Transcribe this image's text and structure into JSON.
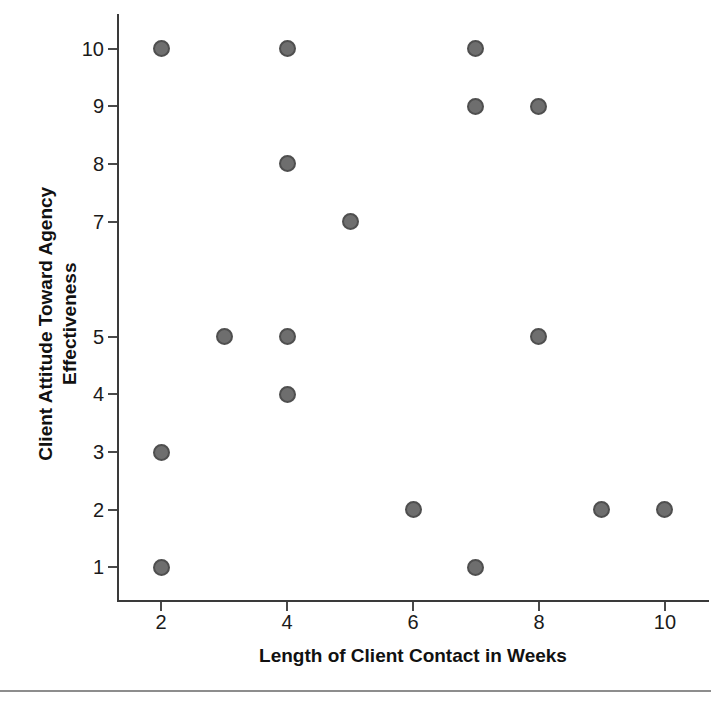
{
  "chart_data": {
    "type": "scatter",
    "title": "",
    "xlabel": "Length of Client Contact in Weeks",
    "ylabel_lines": [
      "Client Attitude Toward Agency",
      "Effectiveness"
    ],
    "ylabel": "Client Attitude Toward Agency Effectiveness",
    "xlim": [
      1.3,
      10.7
    ],
    "ylim": [
      0.4,
      10.6
    ],
    "grid": false,
    "legend": "none",
    "marker": {
      "shape": "circle",
      "fill_color": "#6e6e6e",
      "edge_color": "#4f4f4f",
      "size_px": 17
    },
    "xticks": [
      2,
      4,
      6,
      8,
      10
    ],
    "xtick_labels": [
      "2",
      "4",
      "6",
      "8",
      "10"
    ],
    "yticks": [
      1,
      2,
      3,
      4,
      5,
      7,
      8,
      9,
      10
    ],
    "ytick_labels": [
      "1",
      "2",
      "3",
      "4",
      "5",
      "7",
      "8",
      "9",
      "10"
    ],
    "points": [
      {
        "x": 2,
        "y": 10
      },
      {
        "x": 2,
        "y": 3
      },
      {
        "x": 2,
        "y": 1
      },
      {
        "x": 3,
        "y": 5
      },
      {
        "x": 4,
        "y": 10
      },
      {
        "x": 4,
        "y": 8
      },
      {
        "x": 4,
        "y": 5
      },
      {
        "x": 4,
        "y": 4
      },
      {
        "x": 5,
        "y": 7
      },
      {
        "x": 6,
        "y": 2
      },
      {
        "x": 7,
        "y": 10
      },
      {
        "x": 7,
        "y": 9
      },
      {
        "x": 7,
        "y": 1
      },
      {
        "x": 8,
        "y": 9
      },
      {
        "x": 8,
        "y": 5
      },
      {
        "x": 9,
        "y": 2
      },
      {
        "x": 10,
        "y": 2
      }
    ],
    "n_points": 17
  }
}
